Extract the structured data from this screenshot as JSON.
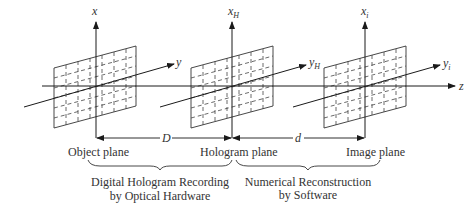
{
  "diagram": {
    "axes": {
      "object": {
        "x_label": "x",
        "y_label": "y"
      },
      "hologram": {
        "x_label": "x",
        "x_sub": "H",
        "y_label": "y",
        "y_sub": "H"
      },
      "image": {
        "x_label": "x",
        "x_sub": "i",
        "y_label": "y",
        "y_sub": "i"
      },
      "z_label": "z"
    },
    "distances": {
      "D": "D",
      "d": "d"
    },
    "planes": {
      "object": "Object plane",
      "hologram": "Hologram plane",
      "image": "Image plane"
    },
    "stages": {
      "recording_line1": "Digital Hologram Recording",
      "recording_line2": "by Optical Hardware",
      "reconstruction_line1": "Numerical Reconstruction",
      "reconstruction_line2": "by Software"
    }
  }
}
